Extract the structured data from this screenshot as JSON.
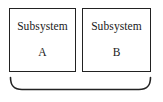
{
  "diagram": {
    "type": "block-diagram",
    "background_color": "#ffffff",
    "stroke_color": "#222222",
    "text_color": "#1a1a1a",
    "blocks": [
      {
        "id": "a",
        "title": "Subsystem",
        "letter": "A"
      },
      {
        "id": "b",
        "title": "Subsystem",
        "letter": "B"
      }
    ],
    "brace": {
      "name": "grouping-brace",
      "orientation": "bottom",
      "label": ""
    }
  }
}
